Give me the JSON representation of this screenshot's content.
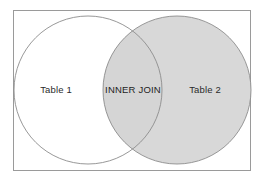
{
  "diagram": {
    "type": "venn",
    "frame": {
      "border_color": "#9a9a9a",
      "background_color": "#ffffff"
    },
    "colors": {
      "shaded_fill": "#d8d8d8",
      "unshaded_fill": "#ffffff",
      "circle_stroke": "#8c8c8c",
      "text": "#2b2b2b"
    },
    "sets": [
      {
        "id": "left-circle",
        "label": "Table 1",
        "fill": "#ffffff",
        "shaded": false
      },
      {
        "id": "right-circle",
        "label": "Table 2",
        "fill": "#d8d8d8",
        "shaded": true
      }
    ],
    "intersection": {
      "id": "intersection-region",
      "label": "INNER JOIN",
      "fill": "#d8d8d8",
      "shaded": true
    }
  }
}
